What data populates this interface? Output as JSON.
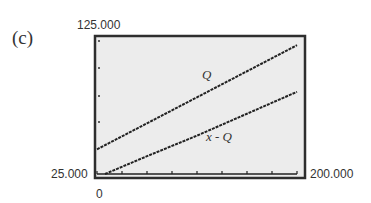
{
  "panel": {
    "label": "(c)"
  },
  "axes": {
    "y_max_label": "125.000",
    "y_min_label": "25.000",
    "x_max_label": "200.000",
    "x_min_label": "0"
  },
  "colors": {
    "frame": "#2e2e2e",
    "plot_background": "#ececec",
    "line": "#222222"
  },
  "chart_data": {
    "type": "line",
    "title": "",
    "xlabel": "",
    "ylabel": "",
    "xlim": [
      0,
      200
    ],
    "ylim": [
      25,
      125
    ],
    "x_ticks_count": 8,
    "grid": false,
    "legend": "inline labels",
    "series": [
      {
        "name": "Q",
        "x": [
          0,
          50,
          100,
          150,
          200
        ],
        "values": [
          43,
          62,
          81,
          100,
          119
        ]
      },
      {
        "name": "x - Q",
        "x": [
          8,
          50,
          100,
          150,
          200
        ],
        "values": [
          25,
          38,
          53,
          69,
          85
        ]
      }
    ],
    "annotations": [
      "Q",
      "x - Q"
    ]
  }
}
